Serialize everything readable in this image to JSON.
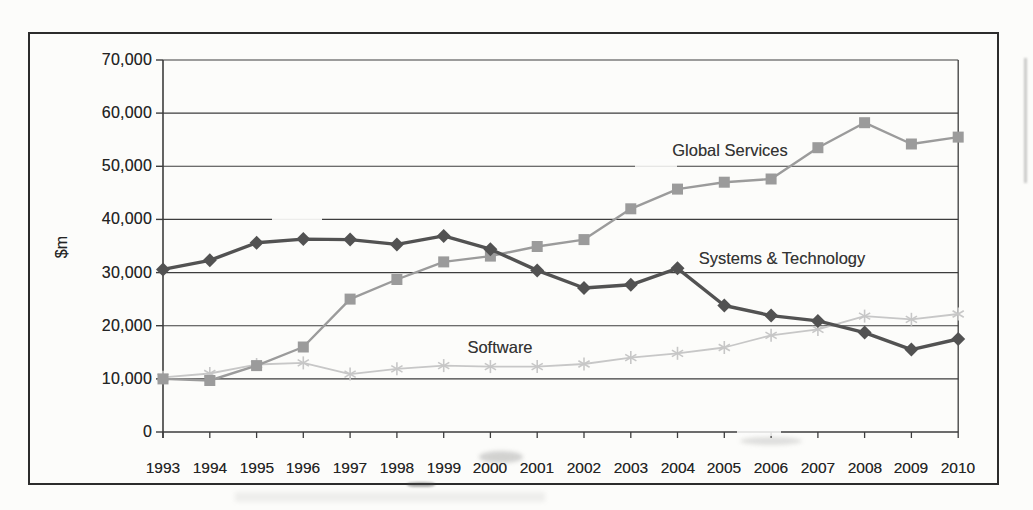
{
  "chart_data": {
    "type": "line",
    "title": "",
    "xlabel": "",
    "ylabel": "$m",
    "ylim": [
      0,
      70000
    ],
    "grid": "horizontal",
    "legend": "inline-labels",
    "y_tick_values": [
      0,
      10000,
      20000,
      30000,
      40000,
      50000,
      60000,
      70000
    ],
    "y_tick_labels": [
      "0",
      "10,000",
      "20,000",
      "30,000",
      "40,000",
      "50,000",
      "60,000",
      "70,000"
    ],
    "categories": [
      "1993",
      "1994",
      "1995",
      "1996",
      "1997",
      "1998",
      "1999",
      "2000",
      "2001",
      "2002",
      "2003",
      "2004",
      "2005",
      "2006",
      "2007",
      "2008",
      "2009",
      "2010"
    ],
    "series": [
      {
        "name": "Global Services",
        "marker": "square",
        "color": "#9b9b9b",
        "values": [
          10000,
          9700,
          12500,
          16000,
          25000,
          28700,
          32000,
          33100,
          34900,
          36200,
          42000,
          45700,
          47000,
          47600,
          53500,
          58200,
          54200,
          55500
        ]
      },
      {
        "name": "Systems & Technology",
        "marker": "diamond",
        "color": "#525252",
        "values": [
          30600,
          32300,
          35600,
          36300,
          36200,
          35300,
          36900,
          34400,
          30400,
          27100,
          27700,
          30800,
          23800,
          21900,
          20900,
          18700,
          15500,
          17500
        ]
      },
      {
        "name": "Software",
        "marker": "asterisk",
        "color": "#c7c7c7",
        "values": [
          10300,
          11000,
          12700,
          13000,
          10900,
          11900,
          12500,
          12300,
          12300,
          12800,
          14000,
          14800,
          15900,
          18200,
          19300,
          21800,
          21200,
          22200
        ]
      }
    ]
  }
}
